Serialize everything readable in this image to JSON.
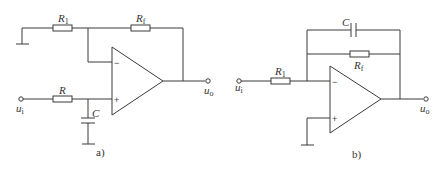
{
  "circuits": [
    {
      "caption": "a)",
      "labels": {
        "r1": "R",
        "r1_sub": "1",
        "rf": "R",
        "rf_sub": "f",
        "r": "R",
        "c": "C",
        "input": "u",
        "input_sub": "i",
        "output": "u",
        "output_sub": "o",
        "minus": "−",
        "plus": "+"
      }
    },
    {
      "caption": "b)",
      "labels": {
        "c": "C",
        "rf": "R",
        "rf_sub": "f",
        "r1": "R",
        "r1_sub": "1",
        "input": "u",
        "input_sub": "i",
        "output": "u",
        "output_sub": "o",
        "minus": "−",
        "plus": "+"
      }
    }
  ]
}
